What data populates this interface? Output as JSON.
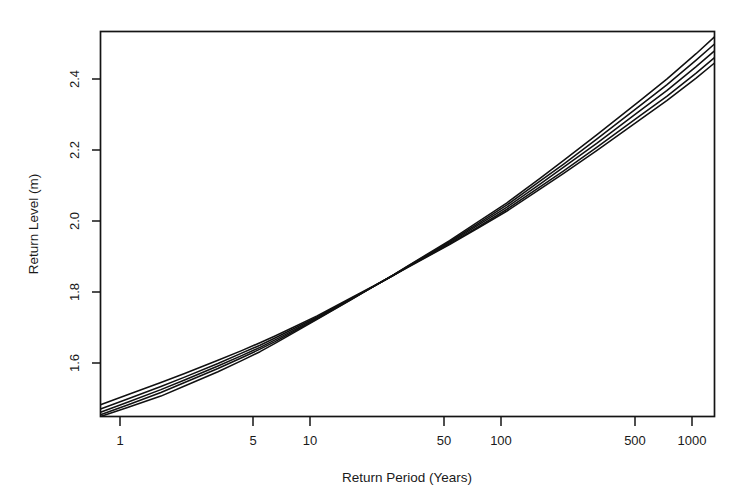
{
  "figure": {
    "background_color": "#ffffff",
    "line_color": "#111111",
    "axis_color": "#141414",
    "width": 753,
    "height": 502
  },
  "axes": {
    "x_title": "Return Period (Years)",
    "y_title": "Return Level (m)",
    "x_tick_labels": [
      "1",
      "5",
      "10",
      "50",
      "100",
      "500",
      "1000"
    ],
    "y_tick_labels": [
      "1.6",
      "1.8",
      "2.0",
      "2.2",
      "2.4"
    ]
  },
  "chart_data": {
    "type": "line",
    "title": "",
    "subtitle": "",
    "xlabel": "Return Period (Years)",
    "ylabel": "Return Level (m)",
    "xscale": "log",
    "yscale": "linear",
    "xlim": [
      0.72,
      1250
    ],
    "ylim": [
      1.473,
      2.548
    ],
    "xticks": [
      1,
      5,
      10,
      50,
      100,
      500,
      1000
    ],
    "xticklabels": [
      "1",
      "5",
      "10",
      "50",
      "100",
      "500",
      "1000"
    ],
    "yticks": [
      1.6,
      1.8,
      2.0,
      2.2,
      2.4
    ],
    "yticklabels": [
      "1.6",
      "1.8",
      "2.0",
      "2.2",
      "2.4"
    ],
    "grid": false,
    "legend": false,
    "legend_position": "none",
    "annotations": [],
    "x": [
      0.72,
      1,
      1.5,
      2,
      3,
      4,
      5,
      6,
      8,
      10,
      15,
      20,
      25,
      30,
      50,
      70,
      100,
      150,
      200,
      300,
      500,
      700,
      1000,
      1250
    ],
    "series": [
      {
        "name": "curve-1",
        "values": [
          1.506,
          1.534,
          1.568,
          1.593,
          1.63,
          1.657,
          1.679,
          1.698,
          1.729,
          1.754,
          1.803,
          1.838,
          1.866,
          1.889,
          1.953,
          1.998,
          2.046,
          2.108,
          2.152,
          2.216,
          2.3,
          2.355,
          2.418,
          2.46
        ]
      },
      {
        "name": "curve-2",
        "values": [
          1.494,
          1.522,
          1.557,
          1.583,
          1.621,
          1.65,
          1.672,
          1.692,
          1.725,
          1.751,
          1.801,
          1.837,
          1.866,
          1.89,
          1.955,
          2.001,
          2.051,
          2.114,
          2.159,
          2.225,
          2.311,
          2.367,
          2.432,
          2.475
        ]
      },
      {
        "name": "curve-3",
        "values": [
          1.485,
          1.513,
          1.548,
          1.575,
          1.614,
          1.643,
          1.666,
          1.687,
          1.721,
          1.748,
          1.8,
          1.837,
          1.866,
          1.891,
          1.958,
          2.006,
          2.057,
          2.122,
          2.169,
          2.236,
          2.325,
          2.383,
          2.45,
          2.494
        ]
      },
      {
        "name": "curve-4",
        "values": [
          1.478,
          1.505,
          1.54,
          1.568,
          1.607,
          1.637,
          1.661,
          1.682,
          1.718,
          1.746,
          1.799,
          1.837,
          1.866,
          1.892,
          1.961,
          2.01,
          2.063,
          2.13,
          2.178,
          2.248,
          2.339,
          2.399,
          2.468,
          2.513
        ]
      },
      {
        "name": "curve-5",
        "values": [
          1.473,
          1.498,
          1.53,
          1.558,
          1.598,
          1.629,
          1.654,
          1.677,
          1.715,
          1.744,
          1.798,
          1.837,
          1.867,
          1.893,
          1.964,
          2.015,
          2.069,
          2.138,
          2.188,
          2.26,
          2.353,
          2.415,
          2.486,
          2.533
        ]
      }
    ]
  }
}
